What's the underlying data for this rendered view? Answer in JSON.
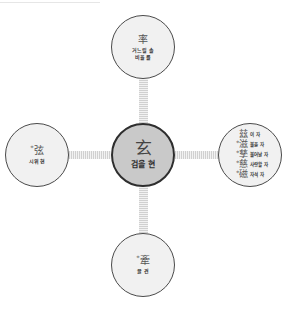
{
  "diagram": {
    "center": {
      "hanja": "玄",
      "gloss": "검을 현"
    },
    "top": {
      "hanja": "率",
      "starred": false,
      "gloss_lines": [
        "거느릴 솔",
        "비율 률"
      ]
    },
    "left": {
      "hanja": "弦",
      "starred": true,
      "gloss_lines": [
        "시위 현"
      ]
    },
    "bottom": {
      "hanja": "牽",
      "starred": true,
      "gloss_lines": [
        "끌 견"
      ]
    },
    "right": {
      "entries": [
        {
          "hanja": "玆",
          "starred": false,
          "gloss": "이 자"
        },
        {
          "hanja": "滋",
          "starred": true,
          "gloss": "불을 자"
        },
        {
          "hanja": "孳",
          "starred": true,
          "gloss": "불어날 자"
        },
        {
          "hanja": "慈",
          "starred": true,
          "gloss": "사랑할 자"
        },
        {
          "hanja": "磁",
          "starred": true,
          "gloss": "자석 자"
        }
      ]
    },
    "star_marker": "*"
  },
  "colors": {
    "center_fill": "#c9c9c9",
    "outer_fill": "#f1f1f1",
    "border": "#4a4a4a",
    "connector": "#d0d0d0"
  }
}
